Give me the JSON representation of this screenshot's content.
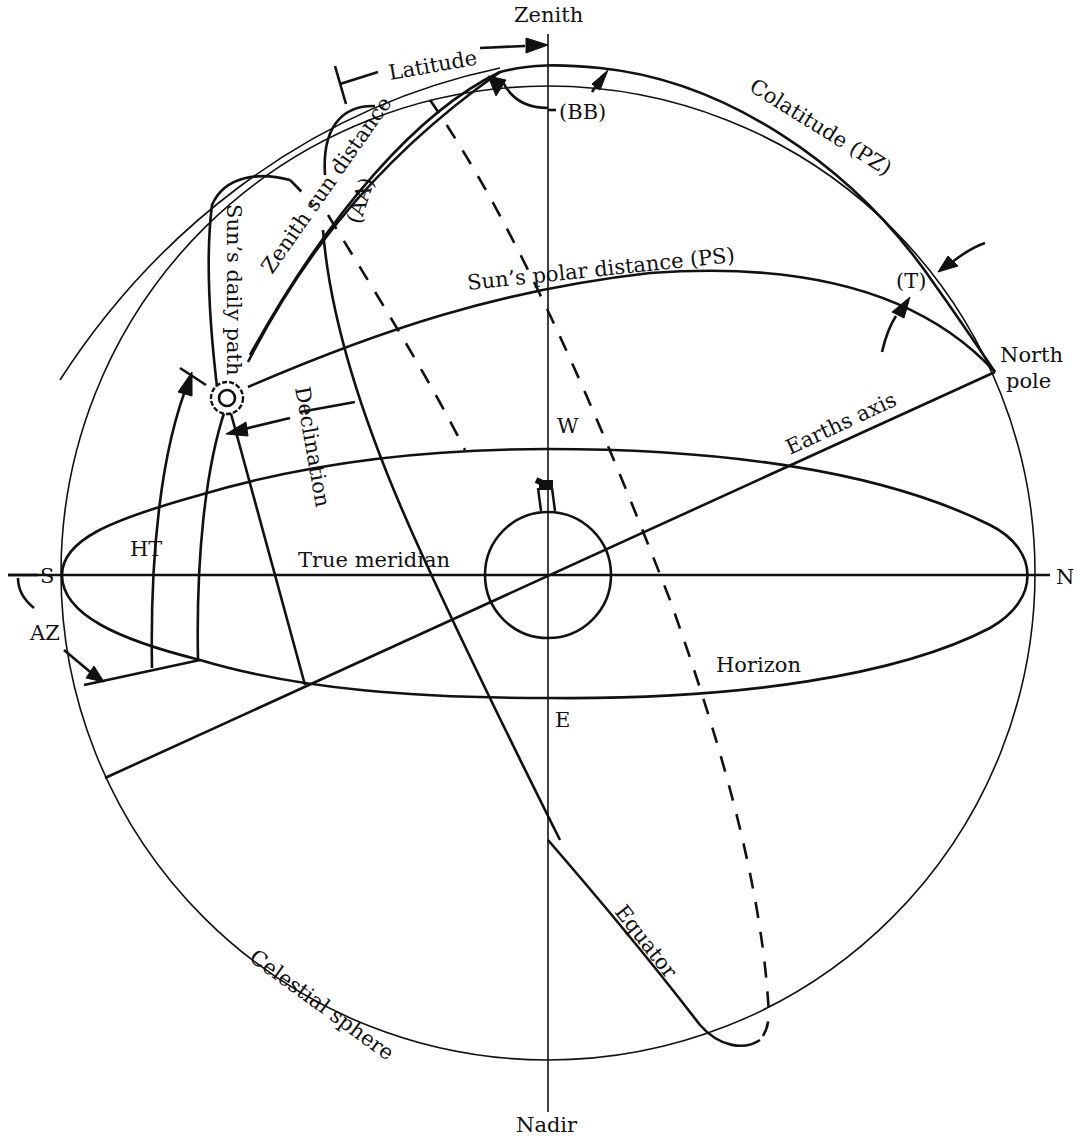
{
  "figure": {
    "colors": {
      "ink": "#111111",
      "background": "#ffffff"
    }
  },
  "labels": {
    "zenith": "Zenith",
    "nadir": "Nadir",
    "latitude": "Latitude",
    "colatitude": "Colatitude (PZ)",
    "bb": "(BB)",
    "aa": "(AA)",
    "t": "(T)",
    "zenith_sun_distance": "Zenith sun distance",
    "suns_daily_path": "Sun’s daily path",
    "suns_polar_distance": "Sun’s polar distance (PS)",
    "north_pole_line1": "North",
    "north_pole_line2": "pole",
    "earths_axis": "Earths axis",
    "declination": "Declination",
    "west": "W",
    "east": "E",
    "south": "S",
    "north": "N",
    "ht": "HT",
    "az": "AZ",
    "true_meridian": "True meridian",
    "horizon": "Horizon",
    "equator": "Equator",
    "celestial_sphere": "Celestial sphere"
  },
  "icons": {
    "sun": "sun-icon",
    "observer": "telescope-icon",
    "earth": "earth-circle"
  }
}
